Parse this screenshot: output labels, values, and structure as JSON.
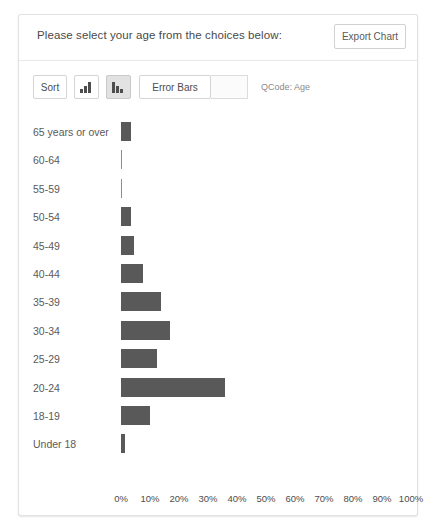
{
  "panel": {
    "prompt": "Please select your age from the choices below:",
    "export_label": "Export Chart"
  },
  "toolbar": {
    "sort_label": "Sort",
    "sort_ascending_icon": "bar-ascending-icon",
    "sort_descending_icon": "bar-descending-icon",
    "sort_descending_active": true,
    "error_bars_label": "Error Bars",
    "error_bars_value": "",
    "qcode_label": "QCode: Age"
  },
  "colors": {
    "bar": "#595959",
    "panel_border": "#e2e2e2",
    "text": "#5a5a5a",
    "toolbar_active": "#e2e2e2"
  },
  "chart_data": {
    "type": "bar",
    "orientation": "horizontal",
    "title": "",
    "xlabel": "",
    "ylabel": "",
    "xlim": [
      0,
      100
    ],
    "grid": false,
    "legend": false,
    "unit": "%",
    "categories": [
      "65 years or over",
      "60-64",
      "55-59",
      "50-54",
      "45-49",
      "40-44",
      "35-39",
      "30-34",
      "25-29",
      "20-24",
      "18-19",
      "Under 18"
    ],
    "values": [
      3.3,
      0.2,
      0.2,
      3.4,
      4.6,
      7.6,
      13.9,
      17.0,
      12.5,
      36.0,
      9.9,
      1.4
    ],
    "tick_labels": [
      "0%",
      "10%",
      "20%",
      "30%",
      "40%",
      "50%",
      "60%",
      "70%",
      "80%",
      "90%",
      "100%"
    ],
    "tick_values": [
      0,
      10,
      20,
      30,
      40,
      50,
      60,
      70,
      80,
      90,
      100
    ]
  }
}
